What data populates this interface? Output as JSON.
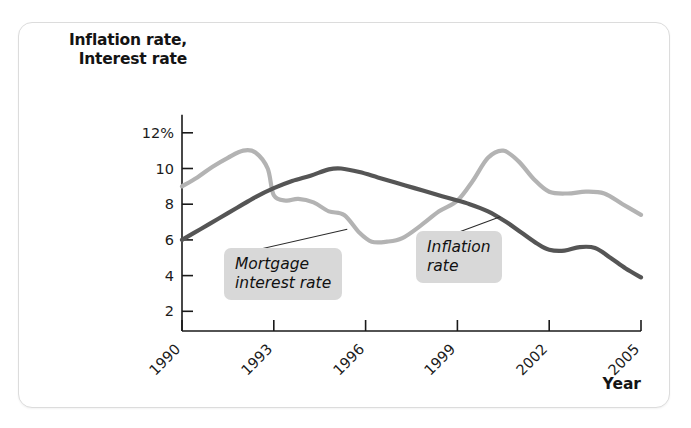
{
  "chart_data": {
    "type": "line",
    "title": "",
    "xlabel": "Year",
    "ylabel": "Inflation rate, Interest rate",
    "ylabel_line1": "Inflation rate,",
    "ylabel_line2": "Interest rate",
    "xlim": [
      1990,
      2005
    ],
    "ylim": [
      0,
      12
    ],
    "grid": false,
    "legend_position": "inline-callouts",
    "ytick_labels": [
      "12%",
      "10",
      "8",
      "6",
      "4",
      "2"
    ],
    "ytick_values": [
      12,
      10,
      8,
      6,
      4,
      2
    ],
    "xtick_labels": [
      "1990",
      "1993",
      "1996",
      "1999",
      "2002",
      "2005"
    ],
    "xtick_values": [
      1990,
      1993,
      1996,
      1999,
      2002,
      2005
    ],
    "series": [
      {
        "name": "Mortgage interest rate",
        "color": "#b3b3b3",
        "x": [
          1990,
          1990.5,
          1991,
          1991.5,
          1992,
          1992.4,
          1992.8,
          1993,
          1993.4,
          1993.8,
          1994.3,
          1994.8,
          1995.3,
          1995.8,
          1996.2,
          1996.7,
          1997.2,
          1997.8,
          1998.4,
          1999,
          1999.5,
          2000,
          2000.5,
          2001,
          2001.5,
          2002,
          2002.6,
          2003.2,
          2003.8,
          2004.4,
          2005
        ],
        "values": [
          9.0,
          9.5,
          10.1,
          10.6,
          11.0,
          10.9,
          10.0,
          8.5,
          8.2,
          8.3,
          8.1,
          7.6,
          7.4,
          6.4,
          5.9,
          5.9,
          6.1,
          6.8,
          7.6,
          8.2,
          9.3,
          10.6,
          11.0,
          10.4,
          9.4,
          8.7,
          8.6,
          8.7,
          8.6,
          8.0,
          7.4
        ]
      },
      {
        "name": "Inflation rate",
        "color": "#555555",
        "x": [
          1990,
          1990.6,
          1991.2,
          1991.8,
          1992.4,
          1993,
          1993.6,
          1994.2,
          1994.8,
          1995.2,
          1995.8,
          1996.4,
          1997,
          1997.6,
          1998.2,
          1998.8,
          1999.4,
          2000,
          2000.6,
          2001.1,
          2001.6,
          2002,
          2002.5,
          2003,
          2003.5,
          2004,
          2004.5,
          2005
        ],
        "values": [
          6.0,
          6.6,
          7.2,
          7.8,
          8.4,
          8.9,
          9.3,
          9.6,
          9.95,
          10.0,
          9.8,
          9.5,
          9.2,
          8.9,
          8.6,
          8.3,
          8.0,
          7.6,
          7.0,
          6.4,
          5.8,
          5.45,
          5.4,
          5.6,
          5.55,
          5.0,
          4.4,
          3.9
        ]
      }
    ],
    "annotations": [
      {
        "text": "Mortgage\ninterest rate",
        "target_series": "Mortgage interest rate",
        "target_x": 1995.4,
        "target_y": 6.6
      },
      {
        "text": "Inflation\nrate",
        "target_series": "Inflation rate",
        "target_x": 2000.4,
        "target_y": 7.3
      }
    ]
  }
}
